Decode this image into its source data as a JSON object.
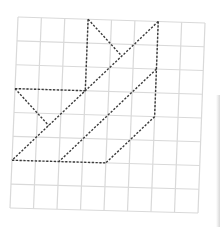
{
  "diagram": {
    "type": "grid-figure",
    "grid": {
      "columns": 8,
      "rows": 8,
      "line_color": "#d9d9d9",
      "corners": {
        "top_left": [
          18,
          17
        ],
        "top_right": [
          205,
          23
        ],
        "bottom_right": [
          198,
          213
        ],
        "bottom_left": [
          10,
          208
        ]
      }
    },
    "figure": {
      "stroke_color": "#3a3a3a",
      "style": "dashed",
      "segments_grid_coords": [
        [
          [
            3,
            0
          ],
          [
            3,
            3
          ]
        ],
        [
          [
            3,
            0
          ],
          [
            4.5,
            1.5
          ]
        ],
        [
          [
            6,
            0
          ],
          [
            0,
            6
          ]
        ],
        [
          [
            0,
            3
          ],
          [
            3,
            3
          ]
        ],
        [
          [
            0,
            3
          ],
          [
            1.5,
            4.5
          ]
        ],
        [
          [
            6,
            0
          ],
          [
            6,
            4
          ]
        ],
        [
          [
            6,
            4
          ],
          [
            4,
            6
          ]
        ],
        [
          [
            6,
            2
          ],
          [
            2,
            6
          ]
        ],
        [
          [
            0,
            6
          ],
          [
            4,
            6
          ]
        ]
      ]
    }
  }
}
